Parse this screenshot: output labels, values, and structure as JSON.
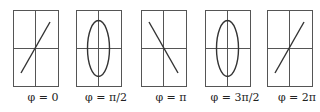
{
  "figure": {
    "panels": [
      {
        "label": "φ = 0",
        "shape": "line-positive",
        "left": 13
      },
      {
        "label": "φ = π/2",
        "shape": "ellipse",
        "left": 76
      },
      {
        "label": "φ = π",
        "shape": "line-negative",
        "left": 141
      },
      {
        "label": "φ = 3π/2",
        "shape": "ellipse",
        "left": 205
      },
      {
        "label": "φ = 2π",
        "shape": "line-positive",
        "left": 267
      }
    ],
    "colors": {
      "stroke": "#333333",
      "grid": "#555555",
      "background": "#ffffff"
    }
  }
}
